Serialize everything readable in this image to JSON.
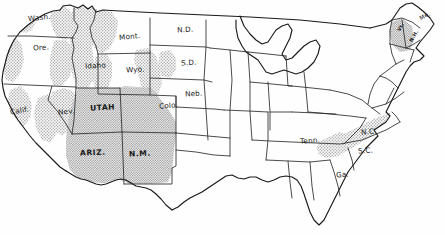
{
  "map": {
    "title": "United States outline map with stippled highland shading",
    "subject": "Mountainous and highland regions of the contiguous United States",
    "style": "hand-drawn pen and ink outline map with halftone stipple shading",
    "colors": {
      "background": "#fefefe",
      "outline": "#1a1a1a",
      "state_border": "#2b2b2b",
      "stipple_fill": "#b9b9b9",
      "stipple_dark": "#9a9a9a",
      "label_text": "#181818"
    },
    "legend_note": "Shaded (stippled) areas indicate mountainous / high-elevation terrain",
    "labels": [
      {
        "id": "wash",
        "text": "Wash.",
        "x": 28,
        "y": 19,
        "style": "sm",
        "rotate": -6
      },
      {
        "id": "ore",
        "text": "Ore.",
        "x": 33,
        "y": 49,
        "style": "sm",
        "rotate": -4
      },
      {
        "id": "calif",
        "text": "Calif.",
        "x": 10,
        "y": 112,
        "style": "sm",
        "rotate": -10
      },
      {
        "id": "nev",
        "text": "Nev.",
        "x": 58,
        "y": 113,
        "style": "sm",
        "rotate": -5
      },
      {
        "id": "idaho",
        "text": "Idaho",
        "x": 87,
        "y": 67,
        "style": "sm",
        "rotate": -3
      },
      {
        "id": "mont",
        "text": "Mont.",
        "x": 120,
        "y": 38,
        "style": "sm",
        "rotate": -5
      },
      {
        "id": "wyo",
        "text": "Wyo.",
        "x": 127,
        "y": 71,
        "style": "sm",
        "rotate": -3
      },
      {
        "id": "utah",
        "text": "UTAH",
        "x": 92,
        "y": 109,
        "style": "bold",
        "rotate": -3
      },
      {
        "id": "colo",
        "text": "Colo.",
        "x": 160,
        "y": 107,
        "style": "sm",
        "rotate": -4
      },
      {
        "id": "ariz",
        "text": "ARIZ.",
        "x": 82,
        "y": 154,
        "style": "bold",
        "rotate": -2
      },
      {
        "id": "nm",
        "text": "N.M.",
        "x": 131,
        "y": 155,
        "style": "bold",
        "rotate": -2
      },
      {
        "id": "nd",
        "text": "N.D.",
        "x": 178,
        "y": 31,
        "style": "sm",
        "rotate": -3
      },
      {
        "id": "sd",
        "text": "S.D.",
        "x": 182,
        "y": 64,
        "style": "sm",
        "rotate": -3
      },
      {
        "id": "neb",
        "text": "Neb.",
        "x": 186,
        "y": 95,
        "style": "sm",
        "rotate": -3
      },
      {
        "id": "tenn",
        "text": "Tenn.",
        "x": 301,
        "y": 142,
        "style": "sm",
        "rotate": -4
      },
      {
        "id": "nc",
        "text": "N.C.",
        "x": 362,
        "y": 133,
        "style": "sm",
        "rotate": -5
      },
      {
        "id": "sc",
        "text": "S.C.",
        "x": 359,
        "y": 152,
        "style": "sm",
        "rotate": -4
      },
      {
        "id": "ga",
        "text": "Ga.",
        "x": 337,
        "y": 176,
        "style": "sm",
        "rotate": -4
      },
      {
        "id": "me",
        "text": "Me.",
        "x": 421,
        "y": 17,
        "style": "xs",
        "rotate": -28
      },
      {
        "id": "vt",
        "text": "Vt.",
        "x": 398,
        "y": 27,
        "style": "tiny",
        "rotate": -62
      },
      {
        "id": "nh",
        "text": "N.H.",
        "x": 409,
        "y": 36,
        "style": "tiny",
        "rotate": -60
      }
    ],
    "shaded_regions": [
      "Cascade Range (Wash., Ore.)",
      "Olympic Peninsula (Wash.)",
      "Coast Ranges and Sierra Nevada (Calif.)",
      "Great Basin ranges (Nev.)",
      "Rocky Mountains (Idaho, western Mont., western Wyo.)",
      "Bighorn and Black Hills (eastern Wyo., western S.D.)",
      "Colorado Rockies (western Colo.)",
      "Colorado Plateau (Utah, Ariz., N.M.)",
      "Appalachian Highlands (Tenn., N.C., S.C., Ga.)",
      "Green and White Mountains (Vt., N.H.)"
    ]
  }
}
